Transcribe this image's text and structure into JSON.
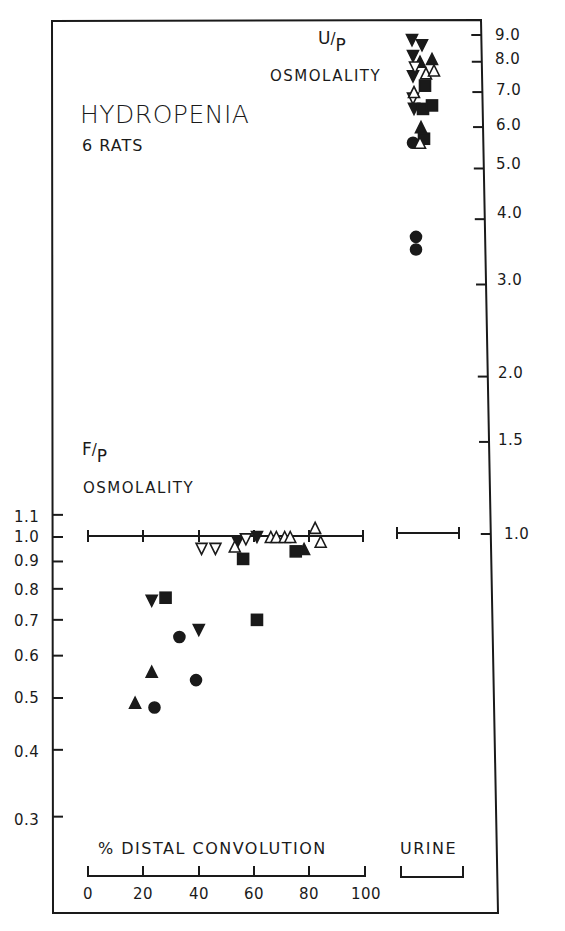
{
  "chart_data": {
    "type": "scatter",
    "title": "HYDROPENIA",
    "subtitle": "6 RATS",
    "panels": [
      {
        "name": "F/P osmolality vs % distal convolution",
        "ylabel": "F/P OSMOLALITY",
        "ylabel_ratio": "F/P",
        "xlabel": "% DISTAL CONVOLUTION",
        "xlim": [
          0,
          100
        ],
        "xticks": [
          0,
          20,
          40,
          60,
          80,
          100
        ],
        "yscale": "log",
        "yticks": [
          1.1,
          1.0,
          0.9,
          0.8,
          0.7,
          0.6,
          0.5,
          0.4,
          0.3
        ],
        "reference_line_y": 1.0,
        "series": [
          {
            "name": "rat-filled-circle",
            "marker": "filled-circle",
            "points": [
              [
                24,
                0.48
              ],
              [
                33,
                0.65
              ],
              [
                39,
                0.54
              ]
            ]
          },
          {
            "name": "rat-filled-triangle",
            "marker": "filled-triangle",
            "points": [
              [
                17,
                0.49
              ],
              [
                23,
                0.56
              ],
              [
                78,
                0.95
              ]
            ]
          },
          {
            "name": "rat-filled-inverted-triangle",
            "marker": "filled-inverted-triangle",
            "points": [
              [
                23,
                0.76
              ],
              [
                40,
                0.67
              ],
              [
                54,
                0.98
              ],
              [
                61,
                1.0
              ]
            ]
          },
          {
            "name": "rat-filled-square",
            "marker": "filled-square",
            "points": [
              [
                28,
                0.77
              ],
              [
                56,
                0.91
              ],
              [
                61,
                0.7
              ],
              [
                75,
                0.94
              ]
            ]
          },
          {
            "name": "rat-open-inverted-triangle",
            "marker": "open-inverted-triangle",
            "points": [
              [
                41,
                0.95
              ],
              [
                46,
                0.95
              ],
              [
                57,
                0.99
              ]
            ]
          },
          {
            "name": "rat-open-triangle",
            "marker": "open-triangle",
            "points": [
              [
                53,
                0.96
              ],
              [
                66,
                1.0
              ],
              [
                68,
                1.0
              ],
              [
                71,
                1.0
              ],
              [
                73,
                1.0
              ],
              [
                82,
                1.04
              ],
              [
                84,
                0.98
              ]
            ]
          }
        ]
      },
      {
        "name": "U/P osmolality (urine)",
        "ylabel": "OSMOLALITY",
        "ylabel_ratio": "U/P",
        "xlabel": "URINE",
        "yscale": "log",
        "yticks": [
          9.0,
          8.0,
          7.0,
          6.0,
          5.0,
          4.0,
          3.0,
          2.0,
          1.5,
          1.0
        ],
        "reference_line_y": 1.0,
        "series": [
          {
            "name": "rat-filled-circle",
            "marker": "filled-circle",
            "values": [
              5.6,
              3.7,
              3.5
            ]
          },
          {
            "name": "rat-filled-triangle",
            "marker": "filled-triangle",
            "values": [
              8.0,
              8.1,
              6.0
            ]
          },
          {
            "name": "rat-filled-inverted-triangle",
            "marker": "filled-inverted-triangle",
            "values": [
              8.8,
              8.6,
              8.2,
              7.5,
              6.5
            ]
          },
          {
            "name": "rat-filled-square",
            "marker": "filled-square",
            "values": [
              7.2,
              6.5,
              6.6,
              5.7
            ]
          },
          {
            "name": "rat-open-inverted-triangle",
            "marker": "open-inverted-triangle",
            "values": [
              7.8,
              6.8
            ]
          },
          {
            "name": "rat-open-triangle",
            "marker": "open-triangle",
            "values": [
              7.6,
              7.7,
              7.0,
              5.6
            ]
          }
        ]
      }
    ],
    "legend": "none",
    "grid": false
  },
  "labels": {
    "title": "HYDROPENIA",
    "subtitle": "6 RATS",
    "up_ratio_num": "U",
    "up_ratio_den": "P",
    "up_axis_name": "OSMOLALITY",
    "fp_ratio_num": "F",
    "fp_ratio_den": "P",
    "fp_axis_name": "OSMOLALITY",
    "x_axis_name": "% DISTAL CONVOLUTION",
    "urine_label": "URINE"
  },
  "axes": {
    "right_ticks": [
      "9.0",
      "8.0",
      "7.0",
      "6.0",
      "5.0",
      "4.0",
      "3.0",
      "2.0",
      "1.5",
      "1.0"
    ],
    "left_ticks": [
      "1.1",
      "1.0",
      "0.9",
      "0.8",
      "0.7",
      "0.6",
      "0.5",
      "0.4",
      "0.3"
    ],
    "x_ticks": [
      "0",
      "20",
      "40",
      "60",
      "80",
      "100"
    ]
  }
}
